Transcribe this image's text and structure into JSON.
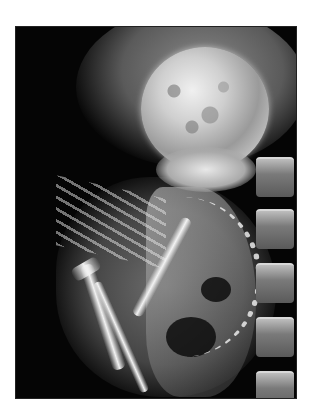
{
  "image": {
    "alt": "Radiograph of a fetus in utero showing fetal skull, curved fetal spine and limbs, with maternal lumbar vertebrae along the right edge",
    "subject": "fetal x-ray",
    "background_color": "#ffffff",
    "frame_color": "#050505"
  },
  "regions": [
    {
      "name": "fetal-skull",
      "label": "Fetal skull"
    },
    {
      "name": "fetal-spine",
      "label": "Fetal spine"
    },
    {
      "name": "fetal-limbs",
      "label": "Fetal limbs"
    },
    {
      "name": "maternal-spine",
      "label": "Maternal lumbar spine"
    }
  ]
}
